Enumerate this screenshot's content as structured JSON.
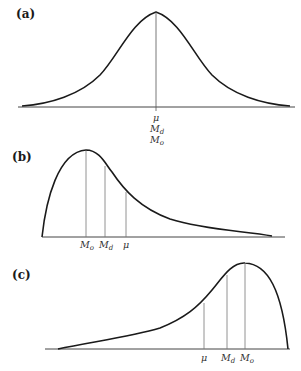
{
  "figure": {
    "panels": [
      {
        "id": "a",
        "label": "(a)",
        "description": "Symmetric distribution",
        "markers": [
          {
            "symbol": "μ",
            "sub": ""
          },
          {
            "symbol": "M",
            "sub": "d"
          },
          {
            "symbol": "M",
            "sub": "o"
          }
        ]
      },
      {
        "id": "b",
        "label": "(b)",
        "description": "Positively (right) skewed distribution",
        "markers": [
          {
            "symbol": "M",
            "sub": "o"
          },
          {
            "symbol": "M",
            "sub": "d"
          },
          {
            "symbol": "μ",
            "sub": ""
          }
        ]
      },
      {
        "id": "c",
        "label": "(c)",
        "description": "Negatively (left) skewed distribution",
        "markers": [
          {
            "symbol": "μ",
            "sub": ""
          },
          {
            "symbol": "M",
            "sub": "d"
          },
          {
            "symbol": "M",
            "sub": "o"
          }
        ]
      }
    ],
    "colors": {
      "curve": "#1a1a1a",
      "axis": "#444444",
      "marker_line": "#777777"
    }
  }
}
